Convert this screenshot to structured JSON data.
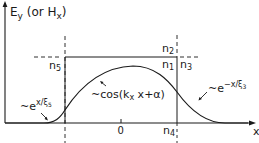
{
  "axes": {
    "y_label": "E",
    "y_label_sub": "y",
    "y_label_paren_open": " (or H",
    "y_label_paren_sub": "x",
    "y_label_paren_close": ")",
    "x_label": "x",
    "origin_label": "0"
  },
  "regions": {
    "n1": {
      "base": "n",
      "sub": "1"
    },
    "n2": {
      "base": "n",
      "sub": "2"
    },
    "n3": {
      "base": "n",
      "sub": "3"
    },
    "n4": {
      "base": "n",
      "sub": "4"
    },
    "n5": {
      "base": "n",
      "sub": "5"
    }
  },
  "annotations": {
    "left_decay": {
      "prefix": "~e",
      "exp": "x/ξ",
      "exp_sub": "5"
    },
    "core": {
      "text": "~cos(k",
      "sub": "x",
      "rest": " x+α)"
    },
    "right_decay": {
      "prefix": "~e",
      "exp": "−x/ξ",
      "exp_sub": "3"
    }
  },
  "colors": {
    "ink": "#1a1a1a",
    "background": "#ffffff"
  }
}
